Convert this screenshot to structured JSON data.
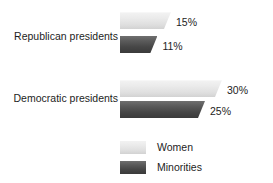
{
  "chart_data": {
    "type": "bar",
    "orientation": "horizontal",
    "title": "",
    "xlabel": "",
    "ylabel": "",
    "categories": [
      "Republican presidents",
      "Democratic presidents"
    ],
    "series": [
      {
        "name": "Women",
        "values": [
          15,
          30
        ],
        "labels": [
          "15%",
          "30%"
        ],
        "color": "#e4e4e4"
      },
      {
        "name": "Minorities",
        "values": [
          11,
          25
        ],
        "labels": [
          "11%",
          "25%"
        ],
        "color": "#4e4e4e"
      }
    ],
    "value_suffix": "%",
    "xlim": [
      0,
      35
    ],
    "grid": false,
    "legend_position": "bottom"
  },
  "axis": {
    "category_labels": {
      "republican": "Republican presidents",
      "democratic": "Democratic presidents"
    }
  },
  "values": {
    "republican_women": "15%",
    "republican_minorities": "11%",
    "democratic_women": "30%",
    "democratic_minorities": "25%"
  },
  "legend": {
    "items": [
      {
        "label": "Women"
      },
      {
        "label": "Minorities"
      }
    ]
  },
  "colors": {
    "women_light": "#eaeaea",
    "minorities_dark": "#4e4e4e",
    "text": "#1d1d1d",
    "background": "#ffffff"
  }
}
